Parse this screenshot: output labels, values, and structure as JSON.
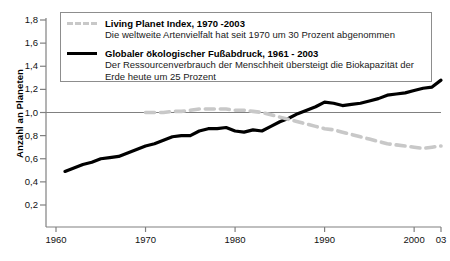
{
  "axes": {
    "ylabel": "Anzahl an Planeten",
    "yticks": [
      "0,2",
      "0,4",
      "0,6",
      "0,8",
      "1,0",
      "1,2",
      "1,4",
      "1,6",
      "1,8"
    ],
    "xticks": [
      "1960",
      "1970",
      "1980",
      "1990",
      "2000",
      "03"
    ]
  },
  "legend": {
    "entries": [
      {
        "style": "dashed",
        "title": "Living Planet Index, 1970 -2003",
        "desc": "Die weltweite Artenvielfalt hat seit 1970 um 30 Prozent abgenommen"
      },
      {
        "style": "solid",
        "title": "Globaler ökologischer Fußabdruck, 1961 - 2003",
        "desc": "Der Ressourcenverbrauch der Menschheit übersteigt die Biokapazität der Erde heute um 25 Prozent"
      }
    ]
  },
  "colors": {
    "footprint_line": "#000000",
    "lpi_line": "#c8c8c8",
    "axis": "#808080",
    "reference_line": "#808080"
  },
  "chart_data": {
    "type": "line",
    "title": "",
    "xlabel": "",
    "ylabel": "Anzahl an Planeten",
    "xlim": [
      1958,
      2003.5
    ],
    "ylim": [
      0.0,
      1.85
    ],
    "yticks": [
      0.2,
      0.4,
      0.6,
      0.8,
      1.0,
      1.2,
      1.4,
      1.6,
      1.8
    ],
    "xticks": [
      1960,
      1970,
      1980,
      1990,
      2000,
      2003
    ],
    "grid": false,
    "legend_position": "top-left",
    "reference_lines": [
      {
        "y": 1.0,
        "label": ""
      }
    ],
    "series": [
      {
        "name": "Globaler ökologischer Fußabdruck, 1961 - 2003",
        "style": "solid",
        "color": "#000000",
        "x": [
          1961,
          1962,
          1963,
          1964,
          1965,
          1966,
          1967,
          1968,
          1969,
          1970,
          1971,
          1972,
          1973,
          1974,
          1975,
          1976,
          1977,
          1978,
          1979,
          1980,
          1981,
          1982,
          1983,
          1984,
          1985,
          1986,
          1987,
          1988,
          1989,
          1990,
          1991,
          1992,
          1993,
          1994,
          1995,
          1996,
          1997,
          1998,
          1999,
          2000,
          2001,
          2002,
          2003
        ],
        "y": [
          0.49,
          0.52,
          0.55,
          0.57,
          0.6,
          0.61,
          0.62,
          0.65,
          0.68,
          0.71,
          0.73,
          0.76,
          0.79,
          0.8,
          0.8,
          0.84,
          0.86,
          0.86,
          0.87,
          0.84,
          0.83,
          0.85,
          0.84,
          0.88,
          0.92,
          0.95,
          0.99,
          1.02,
          1.05,
          1.09,
          1.08,
          1.06,
          1.07,
          1.08,
          1.1,
          1.12,
          1.15,
          1.16,
          1.17,
          1.19,
          1.21,
          1.22,
          1.28
        ]
      },
      {
        "name": "Living Planet Index, 1970 -2003",
        "style": "dashed",
        "color": "#c8c8c8",
        "x": [
          1970,
          1971,
          1972,
          1973,
          1974,
          1975,
          1976,
          1977,
          1978,
          1979,
          1980,
          1981,
          1982,
          1983,
          1984,
          1985,
          1986,
          1987,
          1988,
          1989,
          1990,
          1991,
          1992,
          1993,
          1994,
          1995,
          1996,
          1997,
          1998,
          1999,
          2000,
          2001,
          2002,
          2003
        ],
        "y": [
          1.0,
          1.0,
          1.0,
          1.01,
          1.01,
          1.02,
          1.03,
          1.03,
          1.03,
          1.03,
          1.02,
          1.02,
          1.01,
          1.0,
          0.98,
          0.96,
          0.94,
          0.92,
          0.9,
          0.88,
          0.86,
          0.85,
          0.83,
          0.81,
          0.79,
          0.77,
          0.75,
          0.73,
          0.72,
          0.71,
          0.7,
          0.69,
          0.7,
          0.71
        ]
      }
    ]
  }
}
